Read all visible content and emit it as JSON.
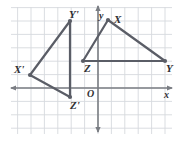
{
  "figure": {
    "kind": "coordinate-grid-geometry-figure",
    "background": "#ffffff",
    "grid_color": "#d6d9de",
    "axis_color": "#7a7d83",
    "shape_color": "#5a5d66",
    "label_color": "#2f2f33",
    "origin_label": "O",
    "x_axis_label": "x",
    "y_axis_label": "y"
  },
  "grid": {
    "cell_px": 13.4,
    "left_px": 11,
    "top_px": 7,
    "right_px": 172,
    "bottom_px": 134,
    "origin_x_px": 98,
    "origin_y_px": 88
  },
  "points": {
    "X": {
      "label": "X",
      "x_px": 108,
      "y_px": 20
    },
    "Y": {
      "label": "Y",
      "x_px": 165,
      "y_px": 61
    },
    "Z": {
      "label": "Z",
      "x_px": 83,
      "y_px": 61
    },
    "Xp": {
      "label": "X'",
      "x_px": 30,
      "y_px": 75
    },
    "Yp": {
      "label": "Y'",
      "x_px": 70,
      "y_px": 21
    },
    "Zp": {
      "label": "Z'",
      "x_px": 70,
      "y_px": 97
    }
  },
  "labels": {
    "X": {
      "text": "X",
      "x_px": 114,
      "y_px": 14
    },
    "Y": {
      "text": "Y",
      "x_px": 166,
      "y_px": 63
    },
    "Z": {
      "text": "Z",
      "x_px": 84,
      "y_px": 63
    },
    "Xp": {
      "text": "X'",
      "x_px": 14,
      "y_px": 64
    },
    "Yp": {
      "text": "Y'",
      "x_px": 69,
      "y_px": 9
    },
    "Zp": {
      "text": "Z'",
      "x_px": 70,
      "y_px": 100
    },
    "O": {
      "text": "O",
      "x_px": 87,
      "y_px": 89
    },
    "x": {
      "text": "x",
      "x_px": 164,
      "y_px": 90
    },
    "y": {
      "text": "y",
      "x_px": 99,
      "y_px": 11
    }
  },
  "triangles": [
    {
      "name": "XYZ",
      "vertices": [
        "X",
        "Y",
        "Z"
      ],
      "closed": true
    },
    {
      "name": "X-prime-Y-prime-Z-prime",
      "vertices": [
        "Xp",
        "Yp",
        "Zp"
      ],
      "closed": true
    }
  ]
}
